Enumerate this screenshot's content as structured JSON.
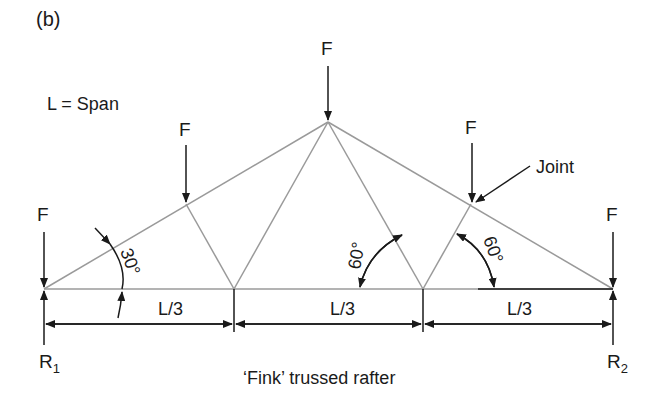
{
  "panel_label": "(b)",
  "legend": "L = Span",
  "caption": "‘Fink’ trussed rafter",
  "loads": {
    "force_label": "F"
  },
  "dimensions": {
    "left": "L/3",
    "middle": "L/3",
    "right": "L/3"
  },
  "reactions": {
    "left": {
      "main": "R",
      "sub": "1"
    },
    "right": {
      "main": "R",
      "sub": "2"
    }
  },
  "angles": {
    "rafter": "30°",
    "web_left": "60°",
    "web_right": "60°"
  },
  "callout": "Joint",
  "colors": {
    "member": "#9a9a9a",
    "ink": "#1a1a1a"
  }
}
